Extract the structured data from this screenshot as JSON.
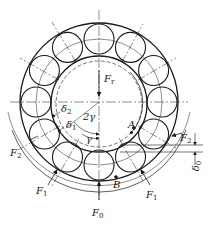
{
  "diagram": {
    "type": "ball-bearing-load-distribution",
    "ball_count": 12,
    "colors": {
      "line": "#1a1a1a",
      "background": "#ffffff"
    },
    "labels": {
      "Fr": {
        "main": "F",
        "sub": "r"
      },
      "F0": {
        "main": "F",
        "sub": "0"
      },
      "F1_left": {
        "main": "F",
        "sub": "1"
      },
      "F1_right": {
        "main": "F",
        "sub": "1"
      },
      "F2_left": {
        "main": "F",
        "sub": "2"
      },
      "F2_right": {
        "main": "F",
        "sub": "2"
      },
      "delta0": {
        "main": "δ",
        "sub": "0"
      },
      "delta1": {
        "main": "δ",
        "sub": "1"
      },
      "delta2": {
        "main": "δ",
        "sub": "2"
      },
      "two_gamma": "2γ",
      "gamma": "γ",
      "A": "A",
      "B": "B"
    }
  }
}
